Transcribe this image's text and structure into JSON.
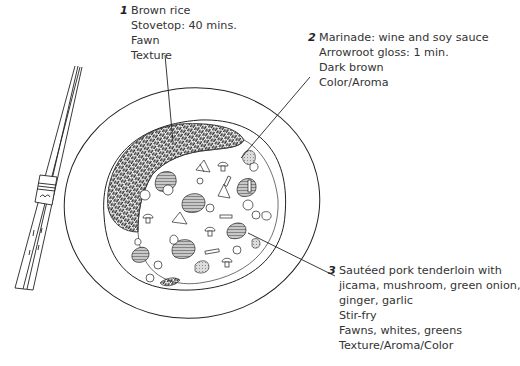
{
  "illustration": {
    "subject": "plate-of-stir-fry-with-brown-rice-and-chopsticks",
    "colors": {
      "ink": "#222222",
      "rice": "#3a3a3a",
      "pork_fill": "#bdbdbd",
      "background": "#ffffff"
    }
  },
  "labels": [
    {
      "number": "1",
      "lines": [
        "Brown rice",
        "Stovetop: 40 mins.",
        "Fawn",
        "Texture"
      ]
    },
    {
      "number": "2",
      "lines": [
        "Marinade: wine and soy sauce",
        "Arrowroot gloss: 1 min.",
        "Dark brown",
        "Color/Aroma"
      ]
    },
    {
      "number": "3",
      "lines": [
        "Sautéed pork tenderloin with",
        "jicama, mushroom, green onion,",
        "ginger, garlic",
        "Stir-fry",
        "Fawns, whites, greens",
        "Texture/Aroma/Color"
      ]
    }
  ]
}
